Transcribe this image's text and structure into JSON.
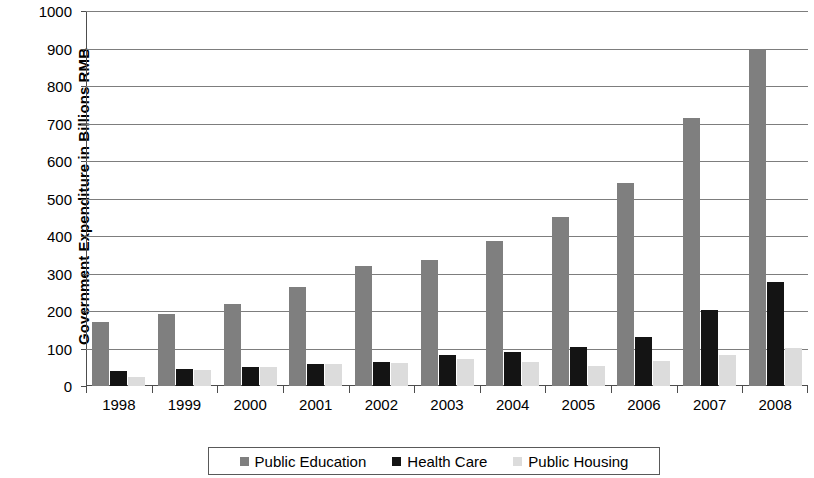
{
  "chart_data": {
    "type": "bar",
    "title": "",
    "xlabel": "",
    "ylabel": "Government Expenditure in Billions RMB",
    "categories": [
      "1998",
      "1999",
      "2000",
      "2001",
      "2002",
      "2003",
      "2004",
      "2005",
      "2006",
      "2007",
      "2008"
    ],
    "ylim": [
      0,
      1000
    ],
    "yticks": [
      0,
      100,
      200,
      300,
      400,
      500,
      600,
      700,
      800,
      900,
      1000
    ],
    "ytick_labels": [
      "0",
      "100",
      "200",
      "300",
      "400",
      "500",
      "600",
      "700",
      "800",
      "900",
      "1000"
    ],
    "grid": true,
    "legend_position": "bottom",
    "series": [
      {
        "name": "Public Education",
        "color": "#7f7f7f",
        "values": [
          172,
          193,
          219,
          265,
          320,
          335,
          387,
          452,
          542,
          714,
          900
        ]
      },
      {
        "name": "Health Care",
        "color": "#141414",
        "values": [
          40,
          46,
          51,
          58,
          64,
          82,
          90,
          105,
          130,
          203,
          278
        ]
      },
      {
        "name": "Public Housing",
        "color": "#dcdcdc",
        "values": [
          23,
          43,
          52,
          59,
          62,
          72,
          63,
          54,
          68,
          84,
          101
        ]
      }
    ]
  }
}
